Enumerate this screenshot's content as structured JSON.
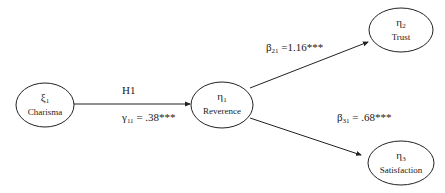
{
  "diagram": {
    "type": "path-model",
    "nodes": [
      {
        "id": "xi1",
        "symbol": "ξ",
        "subscript": "1",
        "label": "Charisma"
      },
      {
        "id": "eta1",
        "symbol": "η",
        "subscript": "1",
        "label": "Reverence"
      },
      {
        "id": "eta2",
        "symbol": "η",
        "subscript": "2",
        "label": "Trust"
      },
      {
        "id": "eta3",
        "symbol": "η",
        "subscript": "3",
        "label": "Satisfaction"
      }
    ],
    "edges": [
      {
        "from": "xi1",
        "to": "eta1",
        "hypothesis": "H1",
        "coef_symbol": "γ",
        "coef_subscript": "11",
        "coef_text": " = .38***"
      },
      {
        "from": "eta1",
        "to": "eta2",
        "coef_symbol": "β",
        "coef_subscript": "21",
        "coef_text": " =1.16***"
      },
      {
        "from": "eta1",
        "to": "eta3",
        "coef_symbol": "β",
        "coef_subscript": "31",
        "coef_text": " = .68***"
      }
    ]
  }
}
